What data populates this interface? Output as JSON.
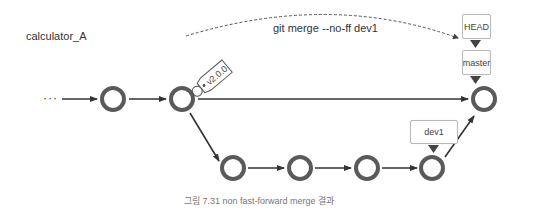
{
  "repo_label": "calculator_A",
  "command_label": "git merge --no-ff dev1",
  "refs": {
    "head": "HEAD",
    "master": "master",
    "dev1": "dev1"
  },
  "tag": "v2.0.0",
  "ellipsis": "···",
  "caption": "그림 7.31 non fast-forward merge 결과",
  "colors": {
    "node_stroke": "#5a5a5a",
    "line": "#333333",
    "box_border": "#b8b8b8"
  }
}
